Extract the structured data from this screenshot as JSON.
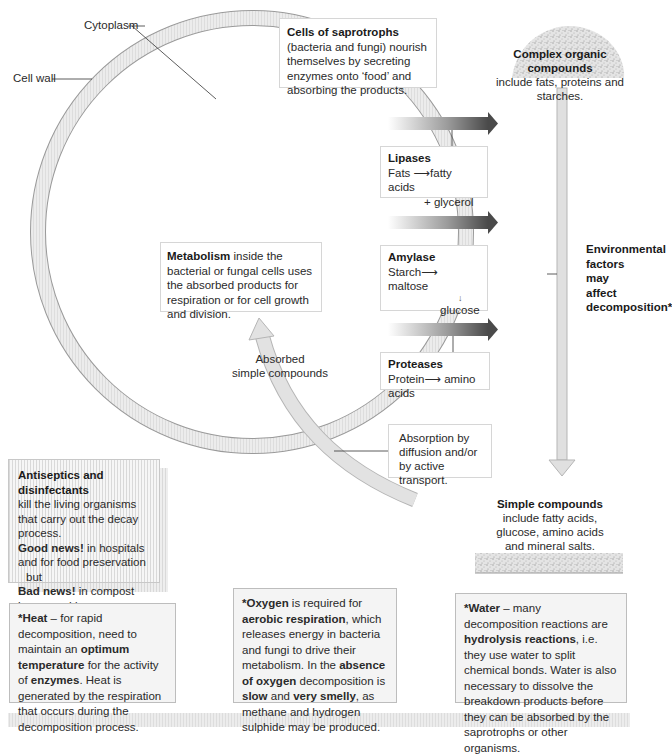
{
  "cell": {
    "labels": {
      "cytoplasm": "Cytoplasm",
      "cell_wall": "Cell wall"
    }
  },
  "saprotrophs_box": {
    "bold": "Cells of saprotrophs",
    "text_1": " (bacteria and fungi) nourish themselves by secreting enzymes onto ‘food’ and absorbing the products."
  },
  "complex_compounds": {
    "title": "Complex organic compounds",
    "subtitle": "include fats, proteins and starches."
  },
  "enzymes": [
    {
      "name": "Lipases",
      "reaction_from": "Fats",
      "reaction_to": "fatty acids",
      "reaction_extra": "+ glycerol"
    },
    {
      "name": "Amylase",
      "reaction_from": "Starch",
      "reaction_to": "maltose",
      "reaction_extra": "glucose"
    },
    {
      "name": "Proteases",
      "reaction_from": "Protein",
      "reaction_to": "amino acids"
    }
  ],
  "metabolism_box": {
    "bold": "Metabolism",
    "text": " inside the bacterial or fungal cells uses the absorbed products for respiration or for cell growth and division."
  },
  "absorbed_label": {
    "line1": "Absorbed",
    "line2": "simple compounds"
  },
  "absorption_box": {
    "text": "Absorption by diffusion and/or by active transport."
  },
  "environmental_label": {
    "text": "Environmental factors may affect decomposition*"
  },
  "simple_compounds": {
    "title": "Simple compounds",
    "text": "include fatty acids, glucose, amino acids and mineral salts."
  },
  "antiseptics_box": {
    "title": "Antiseptics and disinfectants",
    "line1": "kill the living organisms that carry out the decay process.",
    "good_bold": "Good news!",
    "good_text": " in hospitals and for food preservation",
    "but": "but",
    "bad_bold": "Bad news!",
    "bad_text": " in compost heaps and in sewage works."
  },
  "factors": {
    "heat": {
      "b1": "*Heat",
      "t1": " – for rapid decomposition, need to maintain an ",
      "b2": "optimum temperature",
      "t2": " for the activity of ",
      "b3": "enzymes",
      "t3": ". Heat is generated by the respiration that occurs during the decomposition process."
    },
    "oxygen": {
      "b1": "*Oxygen",
      "t1": " is required for ",
      "b2": "aerobic respiration",
      "t2": ", which releases energy in bacteria and fungi to drive their metabolism. In the ",
      "b3": "absence of oxygen",
      "t3": " decomposition is ",
      "b4": "slow",
      "t4": " and ",
      "b5": "very smelly",
      "t5": ", as methane and hydrogen sulphide may be produced."
    },
    "water": {
      "b1": "*Water",
      "t1": " – many decomposition reactions are ",
      "b2": "hydrolysis reactions",
      "t2": ", i.e. they use water to split chemical bonds. Water is also necessary to dissolve the breakdown products before they can be absorbed by the saprotrophs or other organisms."
    }
  },
  "colors": {
    "wall_fill": "#e6e6e6",
    "wall_stroke": "#9a9a9a",
    "arrow_dark": "#555555",
    "box_border": "#d6d6d6"
  }
}
